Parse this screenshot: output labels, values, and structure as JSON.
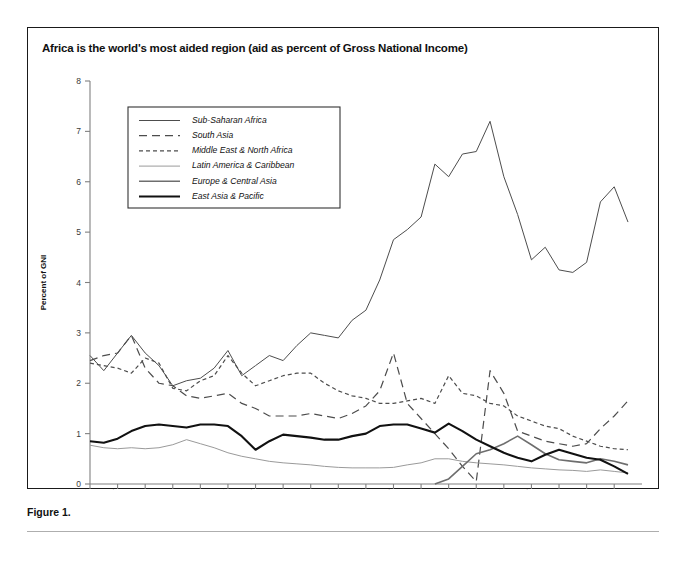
{
  "figure": {
    "title": "Africa is the world's most aided region (aid as percent of Gross National Income)",
    "caption": "Figure 1."
  },
  "chart_data": {
    "type": "line",
    "title": "Africa is the world's most aided region (aid as percent of Gross National Income)",
    "xlabel": "",
    "ylabel": "Percent of GNI",
    "xlim": [
      1965,
      2004
    ],
    "ylim": [
      0,
      8
    ],
    "yticks": [
      "0",
      "1",
      "2",
      "3",
      "4",
      "5",
      "6",
      "7",
      "8"
    ],
    "xticks": [
      "1965",
      "1967",
      "1969",
      "1971",
      "1973",
      "1975",
      "1977",
      "1979",
      "1981",
      "1983",
      "1985",
      "1987",
      "1989",
      "1991",
      "1993",
      "1995",
      "1997",
      "1999",
      "2001",
      "2003"
    ],
    "grid": false,
    "legend_position": "upper-left-inside",
    "x": [
      1965,
      1966,
      1967,
      1968,
      1969,
      1970,
      1971,
      1972,
      1973,
      1974,
      1975,
      1976,
      1977,
      1978,
      1979,
      1980,
      1981,
      1982,
      1983,
      1984,
      1985,
      1986,
      1987,
      1988,
      1989,
      1990,
      1991,
      1992,
      1993,
      1994,
      1995,
      1996,
      1997,
      1998,
      1999,
      2000,
      2001,
      2002,
      2003,
      2004
    ],
    "series": [
      {
        "name": "Sub-Saharan Africa",
        "style": "solid-thin",
        "color": "#4d4d4d",
        "values": [
          2.55,
          2.25,
          2.6,
          2.95,
          2.6,
          2.35,
          1.95,
          2.05,
          2.1,
          2.3,
          2.65,
          2.15,
          2.35,
          2.55,
          2.45,
          2.75,
          3.0,
          2.95,
          2.9,
          3.25,
          3.45,
          4.05,
          4.85,
          5.05,
          5.3,
          6.35,
          6.1,
          6.55,
          6.6,
          7.2,
          6.1,
          5.35,
          4.45,
          4.7,
          4.25,
          4.2,
          4.4,
          5.6,
          5.9,
          5.2
        ]
      },
      {
        "name": "South Asia",
        "style": "long-dash",
        "color": "#4d4d4d",
        "values": [
          2.45,
          2.55,
          2.6,
          2.95,
          2.3,
          2.0,
          1.95,
          1.75,
          1.7,
          1.75,
          1.8,
          1.6,
          1.5,
          1.35,
          1.35,
          1.35,
          1.4,
          1.35,
          1.3,
          1.4,
          1.55,
          1.85,
          2.6,
          1.6,
          1.3,
          1.0,
          0.7,
          0.35,
          0.05,
          2.25,
          1.8,
          1.05,
          0.95,
          0.85,
          0.8,
          0.75,
          0.8,
          1.1,
          1.35,
          1.65
        ]
      },
      {
        "name": "Middle East & North Africa",
        "style": "short-dash",
        "color": "#4d4d4d",
        "values": [
          2.4,
          2.35,
          2.3,
          2.2,
          2.5,
          2.4,
          1.9,
          1.85,
          2.05,
          2.15,
          2.55,
          2.2,
          1.95,
          2.05,
          2.15,
          2.2,
          2.2,
          2.0,
          1.85,
          1.75,
          1.7,
          1.6,
          1.6,
          1.65,
          1.7,
          1.6,
          2.15,
          1.8,
          1.75,
          1.6,
          1.55,
          1.35,
          1.25,
          1.15,
          1.1,
          0.95,
          0.85,
          0.75,
          0.7,
          0.68
        ]
      },
      {
        "name": "Latin America & Caribbean",
        "style": "solid-light",
        "color": "#9a9a9a",
        "values": [
          0.77,
          0.72,
          0.7,
          0.72,
          0.7,
          0.72,
          0.78,
          0.88,
          0.8,
          0.72,
          0.62,
          0.55,
          0.5,
          0.45,
          0.42,
          0.4,
          0.38,
          0.35,
          0.33,
          0.32,
          0.32,
          0.32,
          0.33,
          0.38,
          0.42,
          0.5,
          0.5,
          0.45,
          0.42,
          0.4,
          0.38,
          0.35,
          0.32,
          0.3,
          0.28,
          0.27,
          0.25,
          0.28,
          0.25,
          0.22
        ]
      },
      {
        "name": "Europe & Central Asia",
        "style": "solid-medium",
        "color": "#6e6e6e",
        "values": [
          null,
          null,
          null,
          null,
          null,
          null,
          null,
          null,
          null,
          null,
          null,
          null,
          null,
          null,
          null,
          null,
          null,
          null,
          null,
          null,
          null,
          null,
          null,
          null,
          null,
          0.0,
          0.1,
          0.35,
          0.6,
          0.68,
          0.8,
          0.95,
          0.78,
          0.6,
          0.48,
          0.45,
          0.42,
          0.5,
          0.45,
          0.38
        ]
      },
      {
        "name": "East Asia & Pacific",
        "style": "solid-bold",
        "color": "#111111",
        "values": [
          0.85,
          0.82,
          0.9,
          1.05,
          1.15,
          1.18,
          1.15,
          1.12,
          1.18,
          1.18,
          1.15,
          0.95,
          0.68,
          0.85,
          0.98,
          0.95,
          0.92,
          0.88,
          0.88,
          0.95,
          1.0,
          1.15,
          1.18,
          1.18,
          1.1,
          1.02,
          1.2,
          1.05,
          0.88,
          0.75,
          0.62,
          0.52,
          0.45,
          0.58,
          0.68,
          0.6,
          0.52,
          0.48,
          0.35,
          0.2
        ]
      }
    ]
  },
  "legend": {
    "entries": [
      {
        "label": "Sub-Saharan Africa",
        "style": "solid-thin"
      },
      {
        "label": "South Asia",
        "style": "long-dash"
      },
      {
        "label": "Middle East & North Africa",
        "style": "short-dash"
      },
      {
        "label": "Latin America & Caribbean",
        "style": "solid-light"
      },
      {
        "label": "Europe & Central Asia",
        "style": "solid-medium"
      },
      {
        "label": "East Asia & Pacific",
        "style": "solid-bold"
      }
    ]
  }
}
